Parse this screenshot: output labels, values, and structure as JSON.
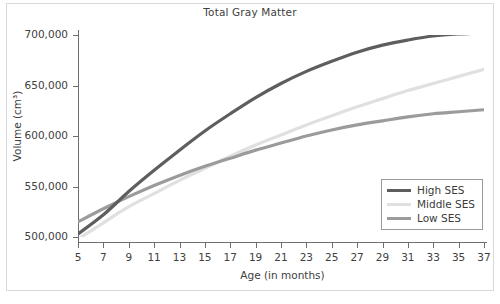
{
  "figure": {
    "title": "Total Gray Matter",
    "source_note": ""
  },
  "legend": {
    "items": [
      {
        "label": "High SES",
        "color": "#5e5e5e"
      },
      {
        "label": "Middle SES",
        "color": "#e0e0e0"
      },
      {
        "label": "Low SES",
        "color": "#9b9b9b"
      }
    ]
  },
  "axes": {
    "x_title": "Age (in months)",
    "y_title": "Volume (cm³)",
    "x_tick_labels": [
      "5",
      "7",
      "9",
      "11",
      "13",
      "15",
      "17",
      "19",
      "21",
      "23",
      "25",
      "27",
      "29",
      "31",
      "33",
      "35",
      "37"
    ],
    "y_tick_labels": [
      "500,000",
      "550,000",
      "600,000",
      "650,000",
      "700,000"
    ]
  },
  "chart_data": {
    "type": "line",
    "title": "Total Gray Matter",
    "xlabel": "Age (in months)",
    "ylabel": "Volume (cm³)",
    "xlim": [
      5,
      37
    ],
    "ylim": [
      490000,
      705000
    ],
    "xticks": [
      5,
      7,
      9,
      11,
      13,
      15,
      17,
      19,
      21,
      23,
      25,
      27,
      29,
      31,
      33,
      35,
      37
    ],
    "yticks": [
      500000,
      550000,
      600000,
      650000,
      700000
    ],
    "grid": false,
    "legend_position": "lower right",
    "x": [
      5,
      7,
      9,
      11,
      13,
      15,
      17,
      19,
      21,
      23,
      25,
      27,
      29,
      31,
      33,
      35,
      37
    ],
    "series": [
      {
        "name": "High SES",
        "color": "#5e5e5e",
        "values": [
          503000,
          522000,
          545000,
          566000,
          586000,
          605000,
          622000,
          638000,
          652000,
          664000,
          674000,
          683000,
          690000,
          695000,
          699000,
          701000,
          702000
        ]
      },
      {
        "name": "Middle SES",
        "color": "#e0e0e0",
        "values": [
          498000,
          514000,
          530000,
          543000,
          556000,
          568000,
          580000,
          591000,
          601000,
          611000,
          620000,
          629000,
          637000,
          645000,
          652000,
          659000,
          666000
        ]
      },
      {
        "name": "Low SES",
        "color": "#9b9b9b",
        "values": [
          515000,
          528000,
          540000,
          551000,
          561000,
          570000,
          578000,
          586000,
          593000,
          600000,
          606000,
          611000,
          615000,
          619000,
          622000,
          624000,
          626000
        ]
      }
    ]
  }
}
